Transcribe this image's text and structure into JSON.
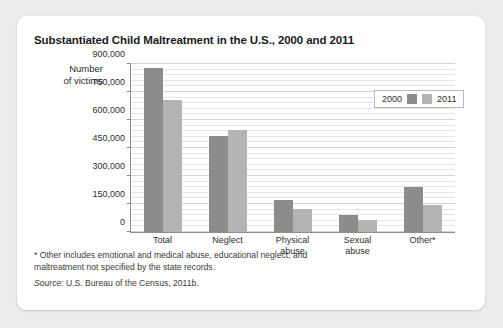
{
  "chart_data": {
    "type": "bar",
    "title": "Substantiated Child Maltreatment in the U.S., 2000 and 2011",
    "xlabel": "",
    "ylabel": "Number of victims",
    "categories": [
      "Total",
      "Neglect",
      "Physical abuse",
      "Sexual abuse",
      "Other*"
    ],
    "series": [
      {
        "name": "2000",
        "color": "#8c8c8c",
        "values": [
          880000,
          512000,
          170000,
          90000,
          240000
        ]
      },
      {
        "name": "2011",
        "color": "#b4b4b4",
        "values": [
          705000,
          545000,
          125000,
          65000,
          145000
        ]
      }
    ],
    "ylim": [
      0,
      900000
    ],
    "yticks": [
      0,
      150000,
      300000,
      450000,
      600000,
      750000,
      900000
    ],
    "ytick_labels": [
      "0",
      "150,000",
      "300,000",
      "450,000",
      "600,000",
      "750,000",
      "900,000"
    ],
    "grid": true,
    "minor_gridlines": true,
    "legend_position": "top-right"
  },
  "axis_title_lines": [
    "Number",
    "of victims"
  ],
  "legend": {
    "entries": [
      {
        "label": "2000"
      },
      {
        "label": "2011"
      }
    ]
  },
  "footnote": "* Other includes emotional and medical abuse, educational neglect, and maltreatment not specified by the state records.",
  "source": {
    "lead": "Source:",
    "text": " U.S. Bureau of the Census, 2011b."
  }
}
